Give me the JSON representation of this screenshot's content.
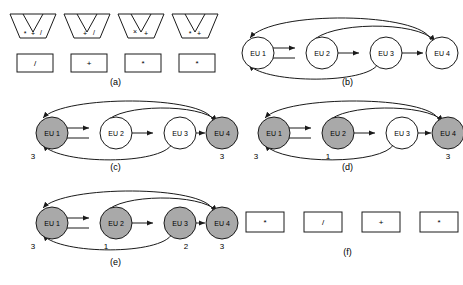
{
  "figure": {
    "panels": [
      {
        "id": "a",
        "label": "(a)",
        "funnels": [
          {
            "name": "funnel-1",
            "ops": [
              "*",
              "+",
              "/"
            ]
          },
          {
            "name": "funnel-2",
            "ops": [
              "+",
              "/"
            ]
          },
          {
            "name": "funnel-3",
            "ops": [
              "×",
              "+"
            ]
          },
          {
            "name": "funnel-4",
            "ops": [
              "*",
              "+"
            ]
          }
        ],
        "boxes": [
          "/",
          "+",
          "*",
          "*"
        ]
      },
      {
        "id": "b",
        "label": "(b)",
        "nodes": [
          {
            "name": "EU 1",
            "shaded": false,
            "count": ""
          },
          {
            "name": "EU 2",
            "shaded": false,
            "count": ""
          },
          {
            "name": "EU 3",
            "shaded": false,
            "count": ""
          },
          {
            "name": "EU 4",
            "shaded": false,
            "count": ""
          }
        ],
        "edges": [
          {
            "from": "EU 1",
            "to": "EU 2",
            "style": "straight-top"
          },
          {
            "from": "EU 2",
            "to": "EU 1",
            "style": "straight-bottom"
          },
          {
            "from": "EU 2",
            "to": "EU 3",
            "style": "straight"
          },
          {
            "from": "EU 3",
            "to": "EU 4",
            "style": "straight"
          },
          {
            "from": "EU 4",
            "to": "EU 1",
            "style": "arc-top-outer"
          },
          {
            "from": "EU 2",
            "to": "EU 4",
            "style": "arc-top-inner"
          },
          {
            "from": "EU 3",
            "to": "EU 1",
            "style": "arc-bottom"
          }
        ]
      },
      {
        "id": "c",
        "label": "(c)",
        "nodes": [
          {
            "name": "EU 1",
            "shaded": true,
            "count": "3"
          },
          {
            "name": "EU 2",
            "shaded": false,
            "count": ""
          },
          {
            "name": "EU 3",
            "shaded": false,
            "count": ""
          },
          {
            "name": "EU 4",
            "shaded": true,
            "count": "3"
          }
        ],
        "edges": [
          {
            "from": "EU 1",
            "to": "EU 2",
            "style": "straight-top"
          },
          {
            "from": "EU 2",
            "to": "EU 1",
            "style": "straight-bottom"
          },
          {
            "from": "EU 2",
            "to": "EU 3",
            "style": "straight"
          },
          {
            "from": "EU 3",
            "to": "EU 4",
            "style": "straight"
          },
          {
            "from": "EU 4",
            "to": "EU 1",
            "style": "arc-top-outer"
          },
          {
            "from": "EU 2",
            "to": "EU 4",
            "style": "arc-top-inner"
          },
          {
            "from": "EU 3",
            "to": "EU 1",
            "style": "arc-bottom"
          }
        ]
      },
      {
        "id": "d",
        "label": "(d)",
        "nodes": [
          {
            "name": "EU 1",
            "shaded": true,
            "count": "3"
          },
          {
            "name": "EU 2",
            "shaded": true,
            "count": "1"
          },
          {
            "name": "EU 3",
            "shaded": false,
            "count": ""
          },
          {
            "name": "EU 4",
            "shaded": true,
            "count": "3"
          }
        ],
        "edges": [
          {
            "from": "EU 1",
            "to": "EU 2",
            "style": "straight-top"
          },
          {
            "from": "EU 2",
            "to": "EU 1",
            "style": "straight-bottom"
          },
          {
            "from": "EU 2",
            "to": "EU 3",
            "style": "straight"
          },
          {
            "from": "EU 3",
            "to": "EU 4",
            "style": "straight"
          },
          {
            "from": "EU 4",
            "to": "EU 1",
            "style": "arc-top-outer"
          },
          {
            "from": "EU 2",
            "to": "EU 4",
            "style": "arc-top-inner"
          },
          {
            "from": "EU 3",
            "to": "EU 1",
            "style": "arc-bottom"
          }
        ]
      },
      {
        "id": "e",
        "label": "(e)",
        "nodes": [
          {
            "name": "EU 1",
            "shaded": true,
            "count": "3"
          },
          {
            "name": "EU 2",
            "shaded": true,
            "count": "1"
          },
          {
            "name": "EU 3",
            "shaded": true,
            "count": "2"
          },
          {
            "name": "EU 4",
            "shaded": true,
            "count": "3"
          }
        ],
        "edges": [
          {
            "from": "EU 1",
            "to": "EU 2",
            "style": "straight-top"
          },
          {
            "from": "EU 2",
            "to": "EU 1",
            "style": "straight-bottom"
          },
          {
            "from": "EU 2",
            "to": "EU 3",
            "style": "straight"
          },
          {
            "from": "EU 3",
            "to": "EU 4",
            "style": "straight"
          },
          {
            "from": "EU 4",
            "to": "EU 1",
            "style": "arc-top-outer"
          },
          {
            "from": "EU 2",
            "to": "EU 4",
            "style": "arc-top-inner"
          },
          {
            "from": "EU 3",
            "to": "EU 1",
            "style": "arc-bottom"
          }
        ]
      },
      {
        "id": "f",
        "label": "(f)",
        "boxes": [
          "*",
          "/",
          "+",
          "*"
        ]
      }
    ],
    "colors": {
      "shaded_node": "#a9a9a9",
      "unshaded_node": "#ffffff",
      "stroke": "#1a1a1a",
      "background": "#ffffff"
    }
  }
}
